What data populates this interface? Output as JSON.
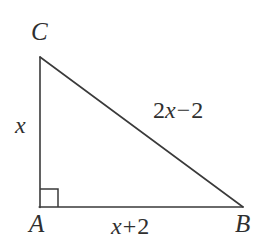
{
  "figure": {
    "type": "right-triangle-diagram",
    "background_color": "#ffffff",
    "stroke_color": "#3a3a3a",
    "text_color": "#2f2f2f",
    "vertices": [
      {
        "name": "C",
        "label": "C",
        "x": 40,
        "y": 57
      },
      {
        "name": "A",
        "label": "A",
        "x": 39,
        "y": 207
      },
      {
        "name": "B",
        "label": "B",
        "x": 243,
        "y": 207
      }
    ],
    "right_angle": {
      "at_vertex": "A",
      "marker": "square",
      "size": 18
    },
    "labels": {
      "vertex_c": "C",
      "vertex_a": "A",
      "vertex_b": "B"
    },
    "sides": {
      "leg_vertical": {
        "from": "A",
        "to": "C",
        "expression": "x",
        "parts": {
          "var": "x"
        }
      },
      "leg_horizontal": {
        "from": "A",
        "to": "B",
        "expression": "x + 2",
        "parts": {
          "coefficient": "",
          "var": "x",
          "operator": "+",
          "constant": "2"
        }
      },
      "hypotenuse": {
        "from": "C",
        "to": "B",
        "expression": "2x − 2",
        "parts": {
          "coefficient": "2",
          "var": "x",
          "operator": "−",
          "constant": "2"
        }
      }
    }
  }
}
